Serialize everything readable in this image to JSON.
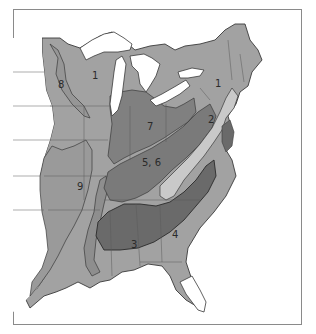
{
  "map": {
    "title": "",
    "type": "zone map of eastern United States",
    "colors": {
      "background": "#ffffff",
      "frame": "#8a8a8a",
      "zone_light": "#c9c9c9",
      "zone_medium": "#a2a2a2",
      "zone_dark": "#808080",
      "zone_darkest": "#6a6a6a",
      "outline": "#3a3a3a",
      "state_border": "#5a5a5a",
      "water": "#ffffff"
    },
    "zone_labels": [
      {
        "id": "1",
        "text": "1",
        "x": 92,
        "y": 79
      },
      {
        "id": "1-ne",
        "text": "1",
        "x": 215,
        "y": 87
      },
      {
        "id": "2",
        "text": "2",
        "x": 210,
        "y": 123
      },
      {
        "id": "3",
        "text": "3",
        "x": 134,
        "y": 244
      },
      {
        "id": "4",
        "text": "4",
        "x": 172,
        "y": 234
      },
      {
        "id": "5-6",
        "text": "5, 6",
        "x": 146,
        "y": 163
      },
      {
        "id": "7",
        "text": "7",
        "x": 149,
        "y": 128
      },
      {
        "id": "8",
        "text": "8",
        "x": 61,
        "y": 84
      },
      {
        "id": "9",
        "text": "9",
        "x": 80,
        "y": 186
      }
    ]
  }
}
